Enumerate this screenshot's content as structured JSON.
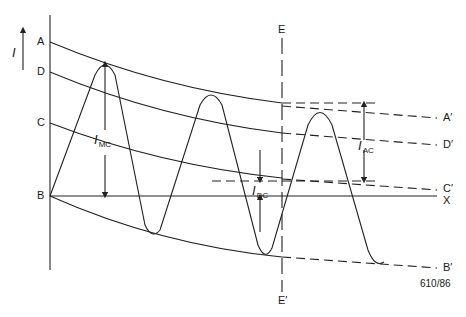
{
  "diagram": {
    "type": "waveform-decay-diagram",
    "axis_label": "I",
    "figure_id": "610/86",
    "left_labels": [
      {
        "text": "A",
        "y": 42
      },
      {
        "text": "D",
        "y": 72
      },
      {
        "text": "C",
        "y": 123
      },
      {
        "text": "B",
        "y": 196
      }
    ],
    "right_labels": [
      {
        "text": "A′",
        "y": 118
      },
      {
        "text": "D′",
        "y": 145
      },
      {
        "text": "C′",
        "y": 190
      },
      {
        "text": "X",
        "y": 197
      },
      {
        "text": "B′",
        "y": 268
      }
    ],
    "vertical_marker": {
      "top": "E",
      "bottom": "E′"
    },
    "annotations": {
      "imc": {
        "main": "I",
        "sub": "MC"
      },
      "idc": {
        "main": "I",
        "sub": "DC"
      },
      "iac": {
        "main": "I",
        "sub": "AC"
      }
    },
    "colors": {
      "stroke": "#222222",
      "background": "#ffffff"
    }
  }
}
